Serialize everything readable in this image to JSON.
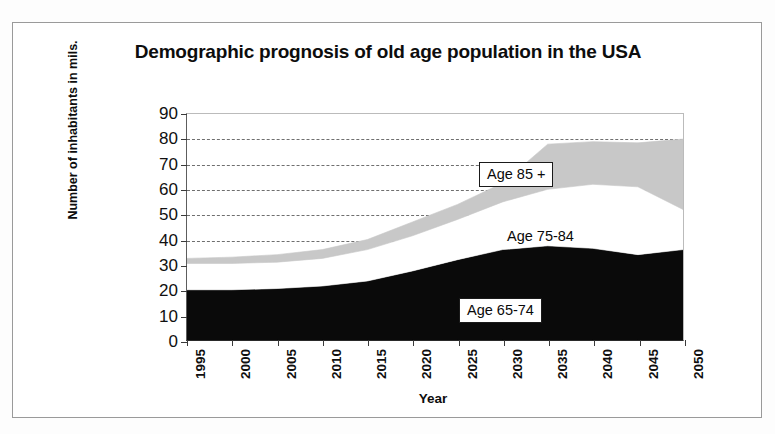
{
  "chart_data": {
    "type": "area",
    "stacked": true,
    "title": "Demographic prognosis of old age population in the USA",
    "xlabel": "Year",
    "ylabel": "Number of inhabitants in mils.",
    "categories": [
      "1995",
      "2000",
      "2005",
      "2010",
      "2015",
      "2020",
      "2025",
      "2030",
      "2035",
      "2040",
      "2045",
      "2050"
    ],
    "x": [
      1995,
      2000,
      2005,
      2010,
      2015,
      2020,
      2025,
      2030,
      2035,
      2040,
      2045,
      2050
    ],
    "ylim": [
      0,
      90
    ],
    "yticks": [
      0,
      10,
      20,
      30,
      40,
      50,
      60,
      70,
      80,
      90
    ],
    "grid": "horizontal-dashed",
    "legend_position": "inline-annotations",
    "series": [
      {
        "name": "Age 65-74",
        "color": "#0a0a0a",
        "values": [
          20,
          20,
          20.5,
          21.5,
          23.5,
          27.5,
          32,
          36,
          37.5,
          36.5,
          34,
          36
        ]
      },
      {
        "name": "Age 75-84",
        "color": "#ffffff",
        "values": [
          10.5,
          10.5,
          10.5,
          11,
          12.5,
          14,
          16,
          19,
          22.5,
          25.5,
          27,
          16
        ]
      },
      {
        "name": "Age 85 +",
        "color": "#c8c8c8",
        "values": [
          2,
          2.5,
          3,
          3.5,
          4,
          5.5,
          6,
          7.5,
          18,
          17,
          17.5,
          28
        ]
      }
    ],
    "cumulative_totals": [
      32.5,
      33,
      34,
      36,
      40,
      47,
      54,
      62.5,
      78,
      79,
      78.5,
      80
    ],
    "annotations": [
      {
        "text": "Age 85 +",
        "series": "Age 85 +",
        "boxed": true
      },
      {
        "text": "Age 75-84",
        "series": "Age 75-84",
        "boxed": false
      },
      {
        "text": "Age 65-74",
        "series": "Age 65-74",
        "boxed": true
      }
    ]
  },
  "figure": {
    "title": "Demographic prognosis of old age population in the USA",
    "x_axis_title": "Year",
    "y_axis_title": "Number of inhabitants in mils."
  }
}
